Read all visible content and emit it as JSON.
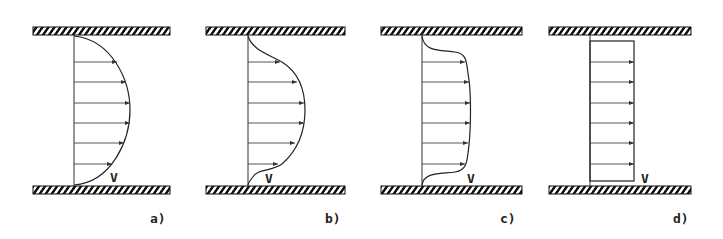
{
  "figure": {
    "velocity_symbol": "V",
    "panels": [
      {
        "id": "a",
        "label": "a)",
        "profile": "parabolic"
      },
      {
        "id": "b",
        "label": "b)",
        "profile": "s-shaped-developing"
      },
      {
        "id": "c",
        "label": "c)",
        "profile": "flattened-turbulent"
      },
      {
        "id": "d",
        "label": "d)",
        "profile": "uniform-plug"
      }
    ],
    "arrows_per_panel": 6
  },
  "colors": {
    "line": "#222222",
    "background": "#ffffff",
    "hatch": "#111111"
  }
}
